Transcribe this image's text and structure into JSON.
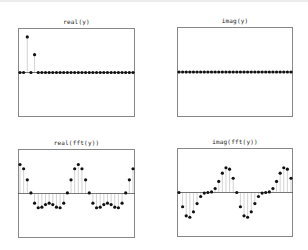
{
  "figure": {
    "background": "#ffffff",
    "frame_color": "#888888",
    "axis_color": "#555555",
    "stem_color": "#c8c8c8",
    "marker_color": "#111111"
  },
  "chart_data": [
    {
      "type": "stem",
      "title": "real(y)",
      "xlabel": "",
      "ylabel": "",
      "x": [
        0,
        1,
        2,
        3,
        4,
        5,
        6,
        7,
        8,
        9,
        10,
        11,
        12,
        13,
        14,
        15,
        16,
        17,
        18,
        19,
        20,
        21,
        22,
        23,
        24,
        25,
        26,
        27,
        28,
        29,
        30,
        31
      ],
      "values": [
        0,
        0,
        1,
        0,
        0.5,
        0,
        0,
        0,
        0,
        0,
        0,
        0,
        0,
        0,
        0,
        0,
        0,
        0,
        0,
        0,
        0,
        0,
        0,
        0,
        0,
        0,
        0,
        0,
        0,
        0,
        0,
        0
      ],
      "ylim": [
        -1.25,
        1.25
      ],
      "grid": false,
      "box": {
        "left": 18,
        "top": 28,
        "width": 117,
        "height": 89
      }
    },
    {
      "type": "stem",
      "title": "imag(y)",
      "xlabel": "",
      "ylabel": "",
      "x": [
        0,
        1,
        2,
        3,
        4,
        5,
        6,
        7,
        8,
        9,
        10,
        11,
        12,
        13,
        14,
        15,
        16,
        17,
        18,
        19,
        20,
        21,
        22,
        23,
        24,
        25,
        26,
        27,
        28,
        29,
        30,
        31
      ],
      "values": [
        0,
        0,
        0,
        0,
        0,
        0,
        0,
        0,
        0,
        0,
        0,
        0,
        0,
        0,
        0,
        0,
        0,
        0,
        0,
        0,
        0,
        0,
        0,
        0,
        0,
        0,
        0,
        0,
        0,
        0,
        0,
        0
      ],
      "ylim": [
        -1,
        1
      ],
      "grid": false,
      "box": {
        "left": 177,
        "top": 27,
        "width": 116,
        "height": 90
      }
    },
    {
      "type": "stem",
      "title": "real(fft(y))",
      "xlabel": "",
      "ylabel": "",
      "x": [
        0,
        1,
        2,
        3,
        4,
        5,
        6,
        7,
        8,
        9,
        10,
        11,
        12,
        13,
        14,
        15,
        16,
        17,
        18,
        19,
        20,
        21,
        22,
        23,
        24,
        25,
        26,
        27,
        28,
        29,
        30,
        31
      ],
      "values": [
        1.5,
        1.278,
        0.707,
        0.029,
        -0.5,
        -0.737,
        -0.707,
        -0.57,
        -0.5,
        -0.57,
        -0.707,
        -0.737,
        -0.5,
        0.029,
        0.707,
        1.278,
        1.5,
        1.278,
        0.707,
        0.029,
        -0.5,
        -0.737,
        -0.707,
        -0.57,
        -0.5,
        -0.57,
        -0.707,
        -0.737,
        -0.5,
        0.029,
        0.707,
        1.278
      ],
      "ylim": [
        -2.3,
        2.3
      ],
      "grid": false,
      "box": {
        "left": 18,
        "top": 149,
        "width": 117,
        "height": 89
      }
    },
    {
      "type": "stem",
      "title": "imag(fft(y))",
      "xlabel": "",
      "ylabel": "",
      "x": [
        0,
        1,
        2,
        3,
        4,
        5,
        6,
        7,
        8,
        9,
        10,
        11,
        12,
        13,
        14,
        15,
        16,
        17,
        18,
        19,
        20,
        21,
        22,
        23,
        24,
        25,
        26,
        27,
        28,
        29,
        30,
        31
      ],
      "values": [
        0,
        -0.737,
        -1.207,
        -1.278,
        -1,
        -0.57,
        -0.207,
        -0.029,
        0,
        0.029,
        0.207,
        0.57,
        1,
        1.278,
        1.207,
        0.737,
        0,
        -0.737,
        -1.207,
        -1.278,
        -1,
        -0.57,
        -0.207,
        -0.029,
        0,
        0.029,
        0.207,
        0.57,
        1,
        1.278,
        1.207,
        0.737
      ],
      "ylim": [
        -2.3,
        2.3
      ],
      "grid": false,
      "box": {
        "left": 177,
        "top": 148,
        "width": 116,
        "height": 89
      }
    }
  ]
}
